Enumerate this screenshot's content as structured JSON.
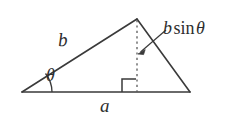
{
  "figure": {
    "background_color": "#ffffff",
    "stroke_color": "#3a3a3a",
    "text_color": "#2e2e2e",
    "width": 233,
    "height": 116
  },
  "labels": {
    "side_b": "b",
    "side_a": "a",
    "angle_theta": "θ",
    "altitude_b": "b",
    "altitude_sin": "sin",
    "altitude_theta": "θ"
  },
  "geometry": {
    "left_vertex": "22,92",
    "right_vertex": "190,92",
    "apex": "137,19",
    "foot_of_altitude": "137,92",
    "altitude_style": "dashed",
    "right_angle_marker": "present",
    "angle_arc": "present",
    "leader_arrow": "present"
  }
}
